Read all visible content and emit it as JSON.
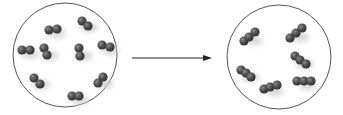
{
  "diagram": {
    "colors": {
      "circle_stroke": "#555555",
      "atom_fill": "#4a4a4a",
      "atom_highlight": "#7a7a7a",
      "arrow": "#222222",
      "shadow": "#cfcfcf"
    },
    "left_container": {
      "cx": 65,
      "cy": 55,
      "r": 52,
      "molecules": [
        {
          "atoms": [
            [
              49,
              30
            ],
            [
              57,
              29
            ]
          ],
          "note": "diatomic"
        },
        {
          "atoms": [
            [
              82,
              21
            ],
            [
              88,
              26
            ]
          ],
          "note": "diatomic"
        },
        {
          "atoms": [
            [
              22,
              50
            ],
            [
              30,
              50
            ]
          ],
          "note": "diatomic"
        },
        {
          "atoms": [
            [
              44,
              48
            ],
            [
              47,
              55
            ]
          ],
          "note": "diatomic"
        },
        {
          "atoms": [
            [
              79,
              48
            ],
            [
              80,
              56
            ]
          ],
          "note": "diatomic"
        },
        {
          "atoms": [
            [
              102,
              45
            ],
            [
              110,
              47
            ]
          ],
          "note": "diatomic"
        },
        {
          "atoms": [
            [
              34,
              78
            ],
            [
              40,
              84
            ]
          ],
          "note": "diatomic"
        },
        {
          "atoms": [
            [
              98,
              83
            ],
            [
              103,
              77
            ]
          ],
          "note": "diatomic"
        },
        {
          "atoms": [
            [
              72,
              96
            ],
            [
              79,
              96
            ]
          ],
          "note": "diatomic"
        }
      ]
    },
    "arrow": {
      "x1": 132,
      "y1": 58,
      "x2": 212,
      "y2": 58
    },
    "right_container": {
      "cx": 279,
      "cy": 57,
      "r": 52,
      "molecules": [
        {
          "atoms": [
            [
              244,
              41
            ],
            [
              249,
              37
            ],
            [
              255,
              32
            ]
          ],
          "note": "triatomic"
        },
        {
          "atoms": [
            [
              290,
              38
            ],
            [
              296,
              33
            ],
            [
              302,
              28
            ]
          ],
          "note": "triatomic"
        },
        {
          "atoms": [
            [
              295,
              56
            ],
            [
              300,
              60
            ],
            [
              306,
              64
            ]
          ],
          "note": "triatomic"
        },
        {
          "atoms": [
            [
              241,
              70
            ],
            [
              246,
              73
            ],
            [
              251,
              77
            ]
          ],
          "note": "triatomic"
        },
        {
          "atoms": [
            [
              297,
              81
            ],
            [
              304,
              81
            ],
            [
              311,
              81
            ]
          ],
          "note": "triatomic"
        },
        {
          "atoms": [
            [
              264,
              89
            ],
            [
              270,
              87
            ],
            [
              277,
              85
            ]
          ],
          "note": "triatomic"
        }
      ]
    }
  }
}
